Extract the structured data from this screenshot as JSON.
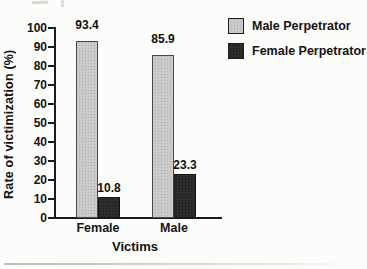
{
  "figure": {
    "background_color": "#fcfcfa",
    "axis_color": "#1c1c1c"
  },
  "chart_data": {
    "type": "bar",
    "title": "",
    "categories": [
      "Female",
      "Male"
    ],
    "series": [
      {
        "name": "Male Perpetrator",
        "values": [
          93.4,
          85.9
        ],
        "color": "#cbcbcb",
        "style": "stippled-light-gray"
      },
      {
        "name": "Female Perpetrator",
        "values": [
          10.8,
          23.3
        ],
        "color": "#2d2d2d",
        "style": "solid-dark"
      }
    ],
    "xlabel": "Victims",
    "ylabel": "Rate of victimization (%)",
    "ylim": [
      0,
      100
    ],
    "ytick_step": 10,
    "yticks": [
      "0",
      "10",
      "20",
      "30",
      "40",
      "50",
      "60",
      "70",
      "80",
      "90",
      "100"
    ],
    "grid": false,
    "legend_position": "top-right",
    "value_labels_shown": true
  }
}
